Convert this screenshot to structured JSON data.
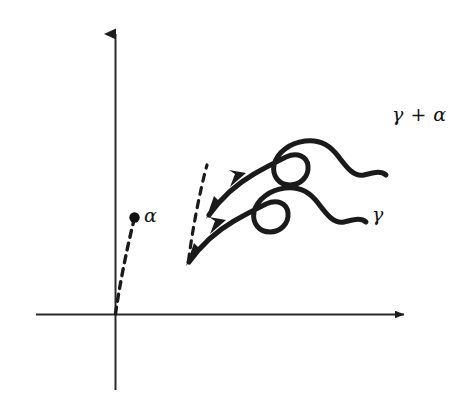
{
  "figure": {
    "kind": "hand-drawn-mathematical-diagram",
    "background_color": "#ffffff",
    "ink_color": "#1a1a1a",
    "labels": {
      "alpha": "α",
      "gamma": "γ",
      "gamma_plus_alpha": "γ + α"
    },
    "axes": {
      "origin": [
        115,
        314
      ],
      "x_axis": {
        "from": [
          36,
          314
        ],
        "to": [
          410,
          314
        ],
        "arrow": "right"
      },
      "y_axis": {
        "from": [
          115,
          390
        ],
        "to": [
          115,
          24
        ],
        "arrow": "up"
      }
    },
    "alpha_vector": {
      "style": "dashed",
      "from": [
        115,
        314
      ],
      "to": [
        135,
        219
      ],
      "endpoint_marker": "filled-dot"
    },
    "translation_connector": {
      "style": "dashed",
      "from": [
        188,
        262
      ],
      "to": [
        208,
        164
      ]
    },
    "curves": [
      {
        "name": "gamma",
        "start": [
          188,
          263
        ],
        "loop_center": [
          268,
          216
        ],
        "end": [
          365,
          223
        ],
        "arrowhead_at": [
          218,
          227
        ],
        "label": "γ"
      },
      {
        "name": "gamma_plus_alpha",
        "start": [
          208,
          163
        ],
        "loop_center": [
          288,
          116
        ],
        "end": [
          385,
          123
        ],
        "arrowhead_at": [
          238,
          127
        ],
        "label": "γ + α"
      }
    ]
  }
}
